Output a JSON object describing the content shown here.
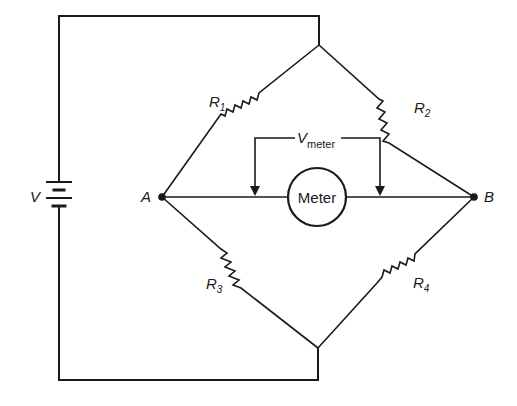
{
  "diagram": {
    "type": "wheatstone-bridge-circuit",
    "source": {
      "label": "V"
    },
    "nodes": [
      {
        "id": "A",
        "label": "A"
      },
      {
        "id": "B",
        "label": "B"
      }
    ],
    "resistors": [
      {
        "id": "R1",
        "label": "R",
        "subscript": "1",
        "between": [
          "top",
          "A"
        ]
      },
      {
        "id": "R2",
        "label": "R",
        "subscript": "2",
        "between": [
          "top",
          "B"
        ]
      },
      {
        "id": "R3",
        "label": "R",
        "subscript": "3",
        "between": [
          "A",
          "bottom"
        ]
      },
      {
        "id": "R4",
        "label": "R",
        "subscript": "4",
        "between": [
          "B",
          "bottom"
        ]
      }
    ],
    "meter": {
      "label": "Meter",
      "voltage_label": "V",
      "voltage_subscript": "meter"
    },
    "colors": {
      "ink": "#1a1a1a",
      "background": "#ffffff"
    }
  }
}
